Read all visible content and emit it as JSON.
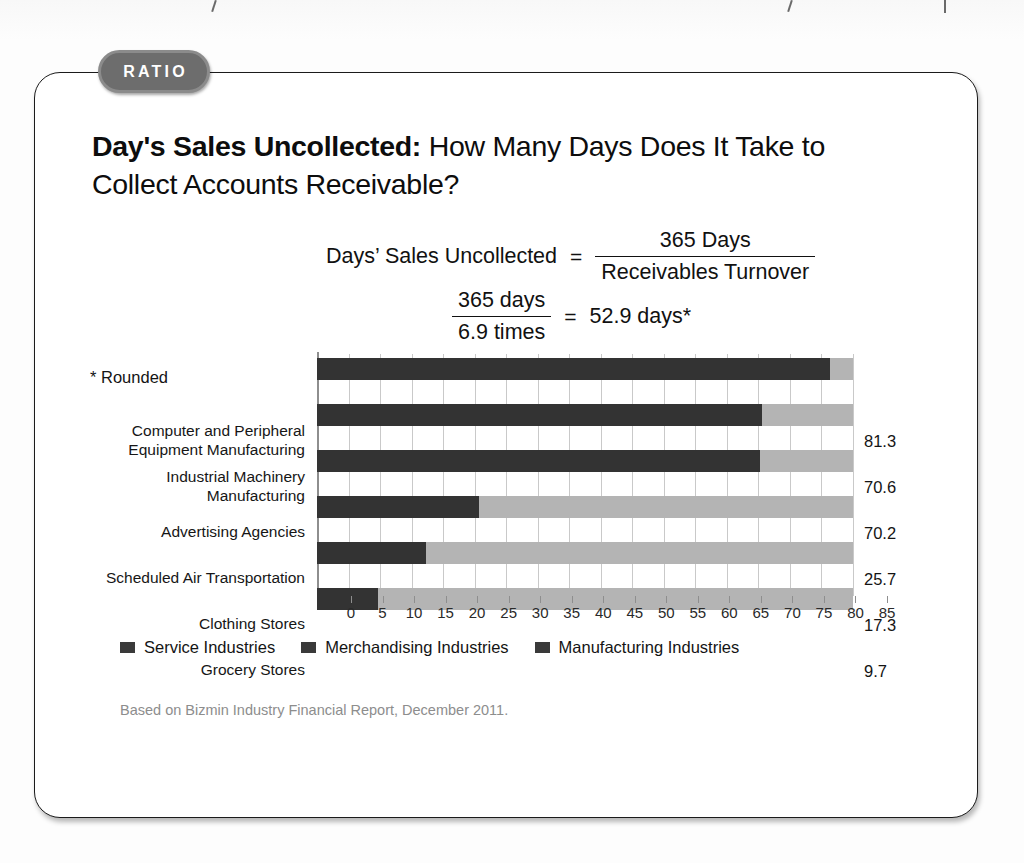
{
  "badge": {
    "label": "RATIO"
  },
  "heading": {
    "bold_part": "Day's Sales Uncollected:",
    "rest": " How Many Days Does It Take to Collect Accounts Receivable?"
  },
  "formula": {
    "line1": {
      "lhs": "Days’ Sales Uncollected",
      "equals": "=",
      "numerator": "365 Days",
      "denominator": "Receivables Turnover"
    },
    "line2": {
      "numerator": "365 days",
      "denominator": "6.9 times",
      "equals": "=",
      "result": "52.9 days*"
    }
  },
  "footnote": "* Rounded",
  "legend": [
    {
      "label": "Service Industries",
      "color": "#3a3a3a"
    },
    {
      "label": "Merchandising Industries",
      "color": "#3a3a3a"
    },
    {
      "label": "Manufacturing Industries",
      "color": "#3a3a3a"
    }
  ],
  "source": "Based on Bizmin Industry Financial Report, December 2011.",
  "colors": {
    "bar_fill": "#333333",
    "bar_track": "#b4b4b4",
    "gridline": "#c9c9c9",
    "axis": "#8e8e8e",
    "badge_bg": "#6d6d6d",
    "card_border": "#1b1b1b"
  },
  "chart_data": {
    "type": "bar",
    "orientation": "horizontal",
    "title": "",
    "xlabel": "",
    "ylabel": "",
    "xlim": [
      0,
      85
    ],
    "xticks": [
      0,
      5,
      10,
      15,
      20,
      25,
      30,
      35,
      40,
      45,
      50,
      55,
      60,
      65,
      70,
      75,
      80,
      85
    ],
    "grid": true,
    "legend_position": "bottom-left",
    "categories": [
      "Computer and Peripheral Equipment Manufacturing",
      "Industrial Machinery Manufacturing",
      "Advertising Agencies",
      "Scheduled Air Transportation",
      "Clothing Stores",
      "Grocery Stores"
    ],
    "category_lines": [
      [
        "Computer and Peripheral",
        "Equipment Manufacturing"
      ],
      [
        "Industrial Machinery",
        "Manufacturing"
      ],
      [
        "Advertising Agencies"
      ],
      [
        "Scheduled Air Transportation"
      ],
      [
        "Clothing Stores"
      ],
      [
        "Grocery Stores"
      ]
    ],
    "values": [
      81.3,
      70.6,
      70.2,
      25.7,
      17.3,
      9.7
    ],
    "value_labels": [
      "81.3",
      "70.6",
      "70.2",
      "25.7",
      "17.3",
      "9.7"
    ],
    "series_group": [
      "Manufacturing Industries",
      "Manufacturing Industries",
      "Service Industries",
      "Service Industries",
      "Merchandising Industries",
      "Merchandising Industries"
    ]
  }
}
